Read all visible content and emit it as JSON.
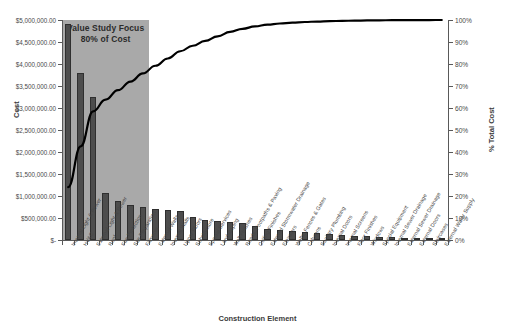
{
  "chart_data": {
    "type": "bar",
    "title": "",
    "xlabel": "Construction Element",
    "ylabel": "Cost",
    "y2label": "% Total Cost",
    "ylim": [
      0,
      5000000
    ],
    "y2lim": [
      0,
      100
    ],
    "grid": false,
    "legend": "none",
    "annotations": [
      {
        "text_line1": "Value Study Focus",
        "text_line2": "80% of Cost",
        "covers_categories": 7
      }
    ],
    "y_tick_labels": [
      "$-",
      "$500,000.00",
      "$1,000,000.00",
      "$1,500,000.00",
      "$2,000,000.00",
      "$2,500,000.00",
      "$3,000,000.00",
      "$3,500,000.00",
      "$4,000,000.00",
      "$4,500,000.00",
      "$5,000,000.00"
    ],
    "y_tick_values": [
      0,
      500000,
      1000000,
      1500000,
      2000000,
      2500000,
      3000000,
      3500000,
      4000000,
      4500000,
      5000000
    ],
    "y2_tick_labels": [
      "0%",
      "10%",
      "20%",
      "30%",
      "40%",
      "50%",
      "60%",
      "70%",
      "80%",
      "90%",
      "100%"
    ],
    "y2_tick_values": [
      0,
      10,
      20,
      30,
      40,
      50,
      60,
      70,
      80,
      90,
      100
    ],
    "categories": [
      "Internal Light & Power",
      "HVAC",
      "External Light & Power",
      "Roof",
      "Fire Protection",
      "Site Preparation",
      "Fitments",
      "External Walls",
      "Internal Walls",
      "Upper Floors",
      "Substructure",
      "Special Services",
      "Landscaping",
      "Wall Finishes",
      "Roads, Footpaths & Paving",
      "Ceiling Finishes",
      "External Stormwater Drainage",
      "Elevators",
      "Walls, Fences & Gates",
      "Columns",
      "Sanitary Plumbing",
      "Internal Doors",
      "Internal Screens",
      "Floor Finishes",
      "Windows",
      "Special Equipment",
      "Internal Sewer Drainage",
      "External Sewer Drainage",
      "External Doors",
      "Staircases",
      "External Water Supply"
    ],
    "series": [
      {
        "name": "Cost",
        "type": "bar",
        "color": "#4d4d4d",
        "values": [
          4900000,
          3800000,
          3250000,
          1070000,
          880000,
          800000,
          760000,
          700000,
          690000,
          660000,
          520000,
          450000,
          430000,
          400000,
          390000,
          310000,
          250000,
          230000,
          200000,
          175000,
          150000,
          130000,
          115000,
          100000,
          85000,
          70000,
          58000,
          45000,
          35000,
          25000,
          15000
        ]
      },
      {
        "name": "% Total Cost",
        "type": "line",
        "color": "#000000",
        "values": [
          24.0,
          42.6,
          58.5,
          63.8,
          68.1,
          72.0,
          75.7,
          79.2,
          82.5,
          85.8,
          88.3,
          90.5,
          92.6,
          94.6,
          96.0,
          97.1,
          97.9,
          98.4,
          98.8,
          99.1,
          99.3,
          99.5,
          99.6,
          99.7,
          99.8,
          99.85,
          99.9,
          99.93,
          99.96,
          99.98,
          100.0
        ]
      }
    ]
  },
  "colors": {
    "bar": "#4d4d4d",
    "bar_edge": "#2f2f2f",
    "line": "#000000",
    "focus_band": "#a9a9a9",
    "axis": "#595959",
    "text": "#3a3a3a",
    "background": "#ffffff"
  }
}
